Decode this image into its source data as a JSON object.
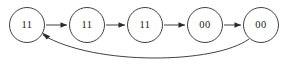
{
  "diagram": {
    "type": "state-transition-chain",
    "canvas": {
      "width": 287,
      "height": 67,
      "background": "#ffffff"
    },
    "stroke_color": "#2b2b2b",
    "text_color": "#1a1a1a",
    "node_radius": 17.5,
    "nodes": [
      {
        "id": "n1",
        "label": "11",
        "cx": 27,
        "cy": 25
      },
      {
        "id": "n2",
        "label": "11",
        "cx": 87,
        "cy": 25
      },
      {
        "id": "n3",
        "label": "11",
        "cx": 145,
        "cy": 25
      },
      {
        "id": "n4",
        "label": "00",
        "cx": 205,
        "cy": 25
      },
      {
        "id": "n5",
        "label": "00",
        "cx": 261,
        "cy": 25
      }
    ],
    "edges": [
      {
        "id": "e1",
        "from": "n1",
        "to": "n2",
        "shape": "straight",
        "path": "M 46 25 L 67 25"
      },
      {
        "id": "e2",
        "from": "n2",
        "to": "n3",
        "shape": "straight",
        "path": "M 106 25 L 125 25"
      },
      {
        "id": "e3",
        "from": "n3",
        "to": "n4",
        "shape": "straight",
        "path": "M 164 25 L 185 25"
      },
      {
        "id": "e4",
        "from": "n4",
        "to": "n5",
        "shape": "straight",
        "path": "M 224 25 L 241 25"
      },
      {
        "id": "e5",
        "from": "n5",
        "to": "n1",
        "shape": "curved-feedback",
        "path": "M 249 39 C 215 64, 95 66, 43 35"
      }
    ],
    "arrow_heads": [
      {
        "id": "a1",
        "points": "67,25 60.5,22.2 60.5,27.8"
      },
      {
        "id": "a2",
        "points": "125,25 118.5,22.2 118.5,27.8"
      },
      {
        "id": "a3",
        "points": "185,25 178.5,22.2 178.5,27.8"
      },
      {
        "id": "a4",
        "points": "241,25 234.5,22.2 234.5,27.8"
      },
      {
        "id": "a5",
        "points": "42,32.5 50.2,36.3 46.6,39.6"
      }
    ]
  }
}
